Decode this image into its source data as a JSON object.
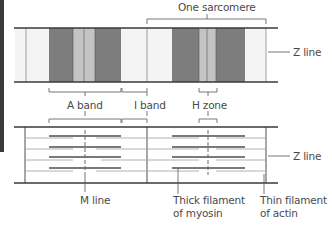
{
  "labels": {
    "one_sarcomere": "One sarcomere",
    "z_line_top": "Z line",
    "a_band": "A band",
    "i_band": "I band",
    "h_zone": "H zone",
    "z_line_bottom": "Z line",
    "m_line": "M line",
    "thick_filament_1": "Thick filament",
    "thick_filament_2": "of myosin",
    "thin_filament_1": "Thin filament",
    "thin_filament_2": "of actin"
  },
  "colors": {
    "dark_band": "#7d7d7d",
    "light_band": "#c4c4c4",
    "white_band": "#f4f4f4",
    "line": "#3a3a3a",
    "thick_filament": "#7a7a7a",
    "thin_filament": "#9a9a9a"
  }
}
